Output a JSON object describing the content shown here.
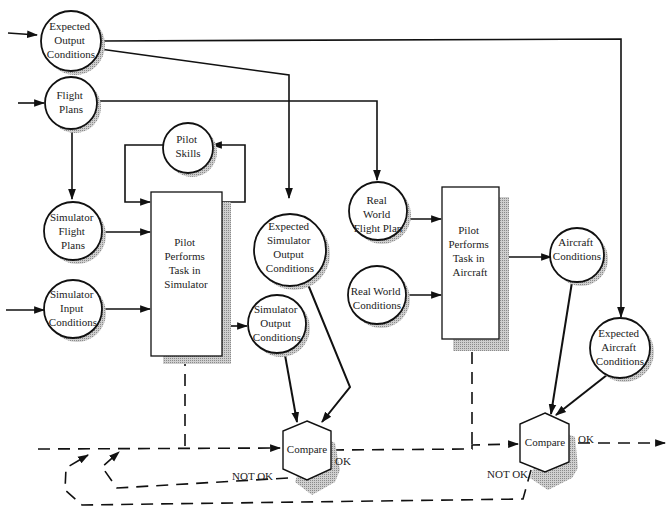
{
  "diagram": {
    "type": "flow-diagram",
    "nodes": {
      "expected_output_conditions": {
        "lines": [
          "Expected",
          "Output",
          "Conditions"
        ]
      },
      "flight_plans": {
        "lines": [
          "Flight",
          "Plans"
        ]
      },
      "pilot_skills": {
        "lines": [
          "Pilot",
          "Skills"
        ]
      },
      "simulator_flight_plans": {
        "lines": [
          "Simulator",
          "Flight",
          "Plans"
        ]
      },
      "simulator_input_conditions": {
        "lines": [
          "Simulator",
          "Input",
          "Conditions"
        ]
      },
      "pilot_performs_task_in_simulator": {
        "lines": [
          "Pilot",
          "Performs",
          "Task in",
          "Simulator"
        ]
      },
      "expected_simulator_output_conditions": {
        "lines": [
          "Expected",
          "Simulator",
          "Output",
          "Conditions"
        ]
      },
      "simulator_output_conditions": {
        "lines": [
          "Simulator",
          "Output",
          "Conditions"
        ]
      },
      "real_world_flight_plan": {
        "lines": [
          "Real",
          "World",
          "Flight Plan"
        ]
      },
      "real_world_conditions": {
        "lines": [
          "Real World",
          "Conditions"
        ]
      },
      "pilot_performs_task_in_aircraft": {
        "lines": [
          "Pilot",
          "Performs",
          "Task in",
          "Aircraft"
        ]
      },
      "aircraft_conditions": {
        "lines": [
          "Aircraft",
          "Conditions"
        ]
      },
      "expected_aircraft_conditions": {
        "lines": [
          "Expected",
          "Aircraft",
          "Conditions"
        ]
      },
      "compare_simulator": {
        "label": "Compare"
      },
      "compare_aircraft": {
        "label": "Compare"
      }
    },
    "edge_labels": {
      "sim_ok": "OK",
      "sim_not_ok": "NOT OK",
      "air_ok": "OK",
      "air_not_ok": "NOT OK"
    },
    "edges": [
      {
        "from": "external",
        "to": "expected_output_conditions"
      },
      {
        "from": "external",
        "to": "flight_plans"
      },
      {
        "from": "expected_output_conditions",
        "to": "expected_simulator_output_conditions"
      },
      {
        "from": "expected_output_conditions",
        "to": "expected_aircraft_conditions"
      },
      {
        "from": "flight_plans",
        "to": "simulator_flight_plans"
      },
      {
        "from": "flight_plans",
        "to": "real_world_flight_plan"
      },
      {
        "from": "pilot_skills",
        "to": "pilot_performs_task_in_simulator"
      },
      {
        "from": "pilot_performs_task_in_simulator",
        "to": "pilot_skills"
      },
      {
        "from": "simulator_flight_plans",
        "to": "pilot_performs_task_in_simulator"
      },
      {
        "from": "external",
        "to": "simulator_input_conditions"
      },
      {
        "from": "simulator_input_conditions",
        "to": "pilot_performs_task_in_simulator"
      },
      {
        "from": "pilot_performs_task_in_simulator",
        "to": "simulator_output_conditions"
      },
      {
        "from": "simulator_output_conditions",
        "to": "compare_simulator"
      },
      {
        "from": "expected_simulator_output_conditions",
        "to": "compare_simulator"
      },
      {
        "from": "real_world_flight_plan",
        "to": "pilot_performs_task_in_aircraft"
      },
      {
        "from": "real_world_conditions",
        "to": "pilot_performs_task_in_aircraft"
      },
      {
        "from": "pilot_performs_task_in_aircraft",
        "to": "aircraft_conditions"
      },
      {
        "from": "aircraft_conditions",
        "to": "compare_aircraft"
      },
      {
        "from": "expected_aircraft_conditions",
        "to": "compare_aircraft"
      },
      {
        "from": "compare_simulator",
        "to": "compare_aircraft",
        "label": "OK",
        "style": "dashed"
      },
      {
        "from": "compare_simulator",
        "to": "pilot_performs_task_in_simulator",
        "label": "NOT OK",
        "style": "dashed"
      },
      {
        "from": "compare_aircraft",
        "to": "pilot_performs_task_in_simulator",
        "label": "NOT OK",
        "style": "dashed"
      },
      {
        "from": "compare_aircraft",
        "to": "external",
        "label": "OK",
        "style": "dashed"
      }
    ]
  }
}
